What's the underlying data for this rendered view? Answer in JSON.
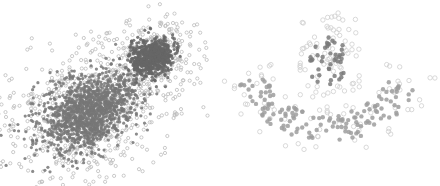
{
  "chart_data": [
    {
      "type": "scatter",
      "title": "",
      "xlabel": "",
      "ylabel": "",
      "grid": false,
      "legend": null,
      "description": "Two Gaussian blobs: large elongated cluster (lower-left) and small dense cluster (upper-right); core points filled dark gray, noise/outlier points drawn as light hollow circles",
      "clusters": [
        {
          "name": "large-blob",
          "center": [
            88,
            112
          ],
          "sx": 26,
          "sy": 17,
          "rot": -0.55,
          "core_n": 1300,
          "noise_n": 700,
          "noise_scale": 1.9,
          "color": "#777777"
        },
        {
          "name": "small-blob",
          "center": [
            152,
            57
          ],
          "sx": 11,
          "sy": 9,
          "rot": -0.3,
          "core_n": 700,
          "noise_n": 260,
          "noise_scale": 2.1,
          "color": "#666666"
        }
      ],
      "noise_color": "#bdbdbd",
      "point_radius": 1.6
    },
    {
      "type": "scatter",
      "title": "",
      "xlabel": "",
      "ylabel": "",
      "grid": false,
      "legend": null,
      "description": "Circle inside crescent (moon-shape) dataset; inner blob dark filled, crescent mid-gray filled, surrounding noise as light hollow circles",
      "clusters": [
        {
          "name": "inner-blob",
          "shape": "blob",
          "center": [
            327,
            60
          ],
          "rx": 20,
          "ry": 25,
          "n": 42,
          "color": "#7a7a7a"
        },
        {
          "name": "crescent",
          "shape": "arc",
          "center": [
            328,
            54
          ],
          "radius_inner": 64,
          "radius_outer": 92,
          "angle_start": 25,
          "angle_end": 160,
          "n": 140,
          "color": "#9e9e9e"
        }
      ],
      "noise": {
        "n": 150,
        "color": "#cfcfcf"
      },
      "point_radius": 2.2
    }
  ]
}
